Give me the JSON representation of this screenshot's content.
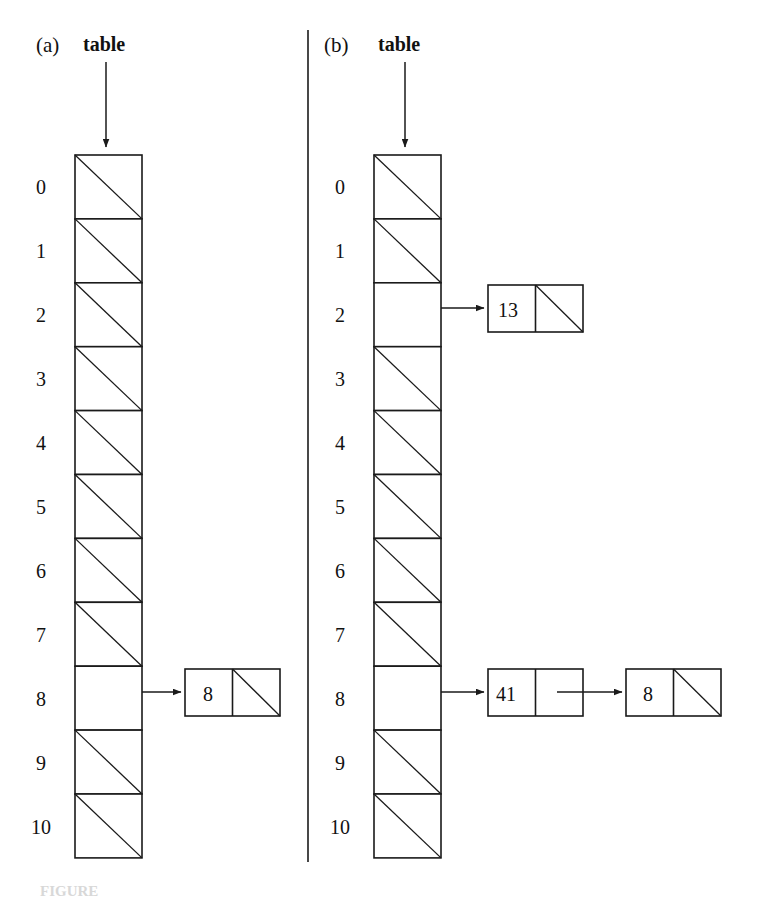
{
  "figure": {
    "caption_partial": "FIGURE",
    "divider": {
      "x": 308,
      "y_top": 30,
      "y_bottom": 862
    }
  },
  "panels": [
    {
      "id": "a",
      "panel_label": "(a)",
      "pointer_label": "table",
      "table": {
        "x": 75,
        "y": 155,
        "width": 67,
        "cell_height": 63.9,
        "slot_labels": [
          "0",
          "1",
          "2",
          "3",
          "4",
          "5",
          "6",
          "7",
          "8",
          "9",
          "10"
        ],
        "empty_slots": [
          0,
          1,
          2,
          3,
          4,
          5,
          6,
          7,
          9,
          10
        ],
        "occupied_slots": [
          8
        ]
      },
      "chains": [
        {
          "slot": 8,
          "nodes": [
            {
              "value": "8",
              "next": "null"
            }
          ]
        }
      ]
    },
    {
      "id": "b",
      "panel_label": "(b)",
      "pointer_label": "table",
      "table": {
        "x": 374,
        "y": 155,
        "width": 67,
        "cell_height": 63.9,
        "slot_labels": [
          "0",
          "1",
          "2",
          "3",
          "4",
          "5",
          "6",
          "7",
          "8",
          "9",
          "10"
        ],
        "empty_slots": [
          0,
          1,
          3,
          4,
          5,
          6,
          7,
          9,
          10
        ],
        "occupied_slots": [
          2,
          8
        ]
      },
      "chains": [
        {
          "slot": 2,
          "nodes": [
            {
              "value": "13",
              "next": "null"
            }
          ]
        },
        {
          "slot": 8,
          "nodes": [
            {
              "value": "41",
              "next": "node"
            },
            {
              "value": "8",
              "next": "null"
            }
          ]
        }
      ]
    }
  ],
  "colors": {
    "ink": "#1a1a1a",
    "paper": "#ffffff",
    "caption_ghost": "#d8d8d8"
  }
}
